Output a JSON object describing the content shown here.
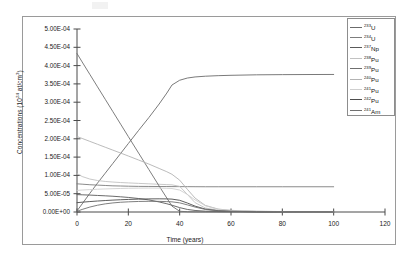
{
  "chart_data": {
    "type": "line",
    "title": "",
    "xlabel": "Time (years)",
    "ylabel": "Concentrations (10^24 at/cm^3)",
    "ylabel_base": "Concentrations (10",
    "ylabel_exp": "24",
    "ylabel_tail": " at/cm",
    "ylabel_tail_exp": "3",
    "ylabel_close": ")",
    "xlim": [
      0,
      120
    ],
    "ylim": [
      0.0,
      0.0005
    ],
    "xticks": [
      0,
      20,
      40,
      60,
      80,
      100,
      120
    ],
    "xtick_labels": [
      "0",
      "20",
      "40",
      "60",
      "80",
      "100",
      "120"
    ],
    "yticks": [
      0.0,
      5e-05,
      0.0001,
      0.00015,
      0.0002,
      0.00025,
      0.0003,
      0.00035,
      0.0004,
      0.00045,
      0.0005
    ],
    "ytick_labels": [
      "0.00E+00",
      "5.00E-05",
      "1.00E-04",
      "1.50E-04",
      "2.00E-04",
      "2.50E-04",
      "3.00E-04",
      "3.50E-04",
      "4.00E-04",
      "4.50E-04",
      "5.00E-04"
    ],
    "grid": false,
    "legend_position": "top-right",
    "x": [
      0,
      2,
      5,
      8,
      11,
      14,
      17,
      20,
      24,
      28,
      32,
      35,
      37,
      40,
      43,
      46,
      50,
      55,
      60,
      70,
      80,
      90,
      100
    ],
    "series": [
      {
        "name": "233U",
        "label_mass": "233",
        "label_element": "U",
        "color": "#6b6b6b",
        "values": [
          3e-06,
          2.2e-05,
          5.1e-05,
          7.9e-05,
          0.000106,
          0.000133,
          0.00016,
          0.000187,
          0.000223,
          0.000258,
          0.000295,
          0.000325,
          0.000347,
          0.00036,
          0.000366,
          0.000369,
          0.000371,
          0.0003725,
          0.0003735,
          0.0003748,
          0.0003753,
          0.0003756,
          0.0003758
        ]
      },
      {
        "name": "234U",
        "label_mass": "234",
        "label_element": "U",
        "color": "#7d7d7d",
        "values": [
          7.7e-05,
          7.6e-05,
          7.45e-05,
          7.35e-05,
          7.25e-05,
          7.15e-05,
          7.1e-05,
          7.05e-05,
          7e-05,
          6.98e-05,
          6.96e-05,
          6.95e-05,
          6.94e-05,
          6.93e-05,
          6.92e-05,
          6.91e-05,
          6.9e-05,
          6.9e-05,
          6.9e-05,
          6.9e-05,
          6.9e-05,
          6.9e-05,
          6.9e-05
        ]
      },
      {
        "name": "237Np",
        "label_mass": "237",
        "label_element": "Np",
        "color": "#5a5a5a",
        "values": [
          4.75e-05,
          4.7e-05,
          4.62e-05,
          4.52e-05,
          4.42e-05,
          4.3e-05,
          4.15e-05,
          3.98e-05,
          3.68e-05,
          3.3e-05,
          2.75e-05,
          2.25e-05,
          1.85e-05,
          1.2e-05,
          7e-06,
          4.2e-06,
          2.2e-06,
          1.2e-06,
          8e-07,
          5e-07,
          4e-07,
          3e-07,
          3e-07
        ]
      },
      {
        "name": "238Pu",
        "label_mass": "238",
        "label_element": "Pu",
        "color": "#c2c2c2",
        "values": [
          0.000105,
          9.7e-05,
          9e-05,
          8.6e-05,
          8.35e-05,
          8.18e-05,
          8.05e-05,
          7.95e-05,
          7.82e-05,
          7.7e-05,
          7.57e-05,
          7.48e-05,
          7.42e-05,
          7e-05,
          4.8e-05,
          2.55e-05,
          1.1e-05,
          5e-06,
          3e-06,
          1.5e-06,
          1e-06,
          8e-07,
          7e-07
        ]
      },
      {
        "name": "239Pu",
        "label_mass": "239",
        "label_element": "Pu",
        "color": "#6f6f6f",
        "values": [
          0.000433,
          0.00041,
          0.000376,
          0.000342,
          0.000308,
          0.000274,
          0.00024,
          0.000206,
          0.000161,
          0.000116,
          7.1e-05,
          3.8e-05,
          1.6e-05,
          2e-06,
          8e-07,
          5e-07,
          3e-07,
          2e-07,
          2e-07,
          1e-07,
          1e-07,
          1e-07,
          1e-07
        ]
      },
      {
        "name": "240Pu",
        "label_mass": "240",
        "label_element": "Pu",
        "color": "#b3b3b3",
        "values": [
          0.000206,
          0.000201,
          0.000193,
          0.000185,
          0.000177,
          0.000169,
          0.000161,
          0.000153,
          0.000142,
          0.000131,
          0.000119,
          0.00011,
          0.000103,
          8.7e-05,
          6.2e-05,
          3.8e-05,
          1.8e-05,
          8e-06,
          4.5e-06,
          2e-06,
          1.2e-06,
          9e-07,
          8e-07
        ]
      },
      {
        "name": "241Pu",
        "label_mass": "241",
        "label_element": "Pu",
        "color": "#cfcfcf",
        "values": [
          5.9e-05,
          6e-05,
          6.12e-05,
          6.22e-05,
          6.3e-05,
          6.37e-05,
          6.43e-05,
          6.48e-05,
          6.52e-05,
          6.54e-05,
          6.52e-05,
          6.48e-05,
          6.42e-05,
          6e-05,
          4.8e-05,
          3.3e-05,
          1.7e-05,
          7.5e-06,
          4e-06,
          1.8e-06,
          1.1e-06,
          8e-07,
          7e-07
        ]
      },
      {
        "name": "242Pu",
        "label_mass": "242",
        "label_element": "Pu",
        "color": "#4d4d4d",
        "values": [
          2.55e-05,
          2.68e-05,
          2.85e-05,
          3e-05,
          3.13e-05,
          3.25e-05,
          3.35e-05,
          3.43e-05,
          3.52e-05,
          3.58e-05,
          3.6e-05,
          3.58e-05,
          3.52e-05,
          3.2e-05,
          2.45e-05,
          1.6e-05,
          8e-06,
          3.5e-06,
          1.8e-06,
          8e-07,
          5e-07,
          4e-07,
          3e-07
        ]
      },
      {
        "name": "241Am",
        "label_mass": "241",
        "label_element": "Am",
        "color": "#707070",
        "values": [
          2e-06,
          7e-06,
          1.35e-05,
          1.85e-05,
          2.22e-05,
          2.48e-05,
          2.66e-05,
          2.78e-05,
          2.88e-05,
          2.92e-05,
          2.9e-05,
          2.84e-05,
          2.78e-05,
          2.5e-05,
          1.95e-05,
          1.35e-05,
          7e-06,
          3.2e-06,
          1.7e-06,
          7e-07,
          4e-07,
          3e-07,
          2e-07
        ]
      }
    ]
  }
}
